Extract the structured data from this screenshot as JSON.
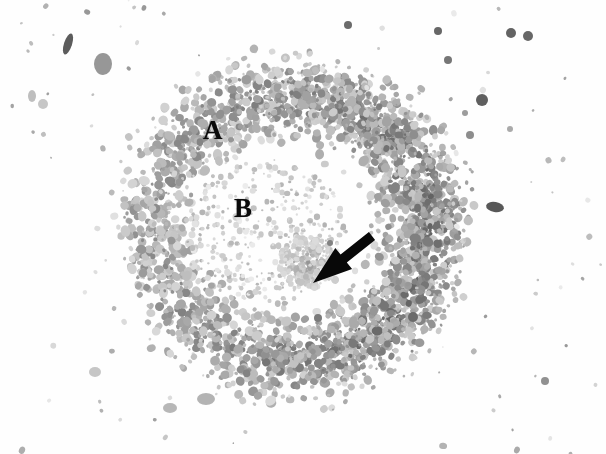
{
  "figure": {
    "kind": "autoradiograph-micrograph",
    "width": 606,
    "height": 454,
    "background_color": "#fefefe",
    "grain_color": "#6b6b6b",
    "ink_color": "#0a0a0a"
  },
  "annotations": {
    "label_a": "A",
    "label_b": "B",
    "arrow": "arrow-pointing-down-left"
  },
  "regions": {
    "outer_ring": {
      "label": "A",
      "center_x": 292,
      "center_y": 228,
      "radius_x": 168,
      "radius_y": 165
    },
    "inner_zone": {
      "label": "B",
      "center_x": 268,
      "center_y": 232,
      "radius_x": 78,
      "radius_y": 72
    }
  },
  "arrow": {
    "tip_x": 313,
    "tip_y": 283,
    "tail_x": 372,
    "tail_y": 236,
    "color": "#080808"
  },
  "chart_data": {
    "type": "heatmap",
    "title": "",
    "xlabel": "",
    "ylabel": "",
    "grain_seed": 20240517,
    "grain_count": 5200,
    "speckle_count": 150,
    "ring": {
      "center": [
        292,
        228
      ],
      "outer_radius": 172,
      "inner_radius": 92,
      "peak_radius": 134,
      "band_sigma": 40
    },
    "density_by_sector": [
      {
        "name": "top",
        "angle_deg": 270,
        "density": 0.72
      },
      {
        "name": "top-right",
        "angle_deg": 315,
        "density": 0.86
      },
      {
        "name": "right",
        "angle_deg": 0,
        "density": 1.0
      },
      {
        "name": "bottom-right",
        "angle_deg": 45,
        "density": 0.94
      },
      {
        "name": "bottom",
        "angle_deg": 90,
        "density": 0.8
      },
      {
        "name": "bottom-left",
        "angle_deg": 135,
        "density": 0.62
      },
      {
        "name": "left",
        "angle_deg": 180,
        "density": 0.55
      },
      {
        "name": "top-left",
        "angle_deg": 225,
        "density": 0.6
      }
    ],
    "debris": [
      {
        "x": 68,
        "y": 44,
        "rx": 4,
        "ry": 11,
        "rot": 18,
        "tone": 0.86
      },
      {
        "x": 103,
        "y": 64,
        "rx": 9,
        "ry": 11,
        "rot": 0,
        "tone": 0.55
      },
      {
        "x": 43,
        "y": 104,
        "rx": 5,
        "ry": 5,
        "rot": 0,
        "tone": 0.3
      },
      {
        "x": 32,
        "y": 96,
        "rx": 4,
        "ry": 6,
        "rot": 0,
        "tone": 0.34
      },
      {
        "x": 495,
        "y": 207,
        "rx": 9,
        "ry": 5,
        "rot": 10,
        "tone": 0.88
      },
      {
        "x": 448,
        "y": 60,
        "rx": 4,
        "ry": 4,
        "rot": 0,
        "tone": 0.72
      },
      {
        "x": 482,
        "y": 100,
        "rx": 6,
        "ry": 6,
        "rot": 0,
        "tone": 0.84
      },
      {
        "x": 465,
        "y": 113,
        "rx": 3,
        "ry": 3,
        "rot": 0,
        "tone": 0.52
      },
      {
        "x": 470,
        "y": 135,
        "rx": 4,
        "ry": 4,
        "rot": 0,
        "tone": 0.6
      },
      {
        "x": 510,
        "y": 129,
        "rx": 3,
        "ry": 3,
        "rot": 0,
        "tone": 0.45
      },
      {
        "x": 438,
        "y": 31,
        "rx": 4,
        "ry": 4,
        "rot": 0,
        "tone": 0.8
      },
      {
        "x": 511,
        "y": 33,
        "rx": 5,
        "ry": 5,
        "rot": 0,
        "tone": 0.82
      },
      {
        "x": 528,
        "y": 36,
        "rx": 5,
        "ry": 5,
        "rot": 0,
        "tone": 0.8
      },
      {
        "x": 348,
        "y": 25,
        "rx": 4,
        "ry": 4,
        "rot": 0,
        "tone": 0.78
      },
      {
        "x": 545,
        "y": 381,
        "rx": 4,
        "ry": 4,
        "rot": 0,
        "tone": 0.58
      },
      {
        "x": 413,
        "y": 317,
        "rx": 5,
        "ry": 5,
        "rot": 0,
        "tone": 0.78
      },
      {
        "x": 318,
        "y": 318,
        "rx": 4,
        "ry": 4,
        "rot": 0,
        "tone": 0.7
      },
      {
        "x": 330,
        "y": 243,
        "rx": 3,
        "ry": 3,
        "rot": 0,
        "tone": 0.66
      },
      {
        "x": 170,
        "y": 408,
        "rx": 7,
        "ry": 5,
        "rot": 0,
        "tone": 0.38
      },
      {
        "x": 206,
        "y": 399,
        "rx": 9,
        "ry": 6,
        "rot": 0,
        "tone": 0.4
      },
      {
        "x": 95,
        "y": 372,
        "rx": 6,
        "ry": 5,
        "rot": 0,
        "tone": 0.3
      }
    ]
  }
}
